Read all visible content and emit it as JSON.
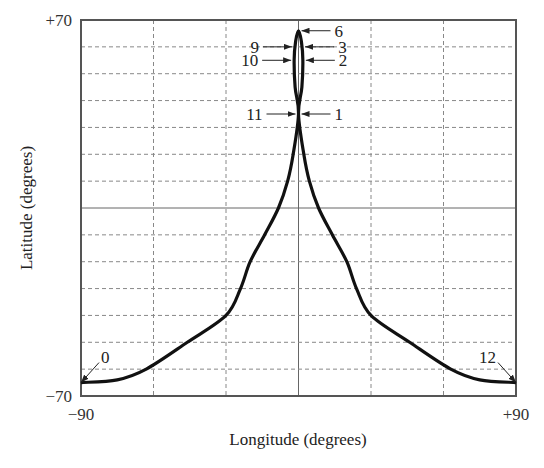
{
  "chart_data": {
    "type": "line",
    "title": "",
    "xlabel": "Longitude (degrees)",
    "ylabel": "Latitude (degrees)",
    "xlim": [
      -90,
      90
    ],
    "ylim": [
      -70,
      70
    ],
    "x_tick_labels": [
      "-90",
      "+90"
    ],
    "y_tick_labels": [
      "+70",
      "-70"
    ],
    "grid": {
      "on": true,
      "style": "dashed",
      "x_step": 30,
      "y_step": 10,
      "solid_lines": {
        "x": 0,
        "y": 0
      }
    },
    "legend": null,
    "series": [
      {
        "name": "ground track",
        "points": [
          [
            -90,
            -65
          ],
          [
            -75,
            -64
          ],
          [
            -63,
            -60
          ],
          [
            -46,
            -50
          ],
          [
            -30,
            -40
          ],
          [
            -24,
            -30
          ],
          [
            -20,
            -20
          ],
          [
            -14,
            -10
          ],
          [
            -8.3,
            0
          ],
          [
            -4.5,
            10
          ],
          [
            -2.2,
            20
          ],
          [
            0,
            35
          ],
          [
            -1.4,
            45
          ],
          [
            -1.8,
            55
          ],
          [
            -1.2,
            62
          ],
          [
            0,
            66
          ],
          [
            1.2,
            62
          ],
          [
            1.8,
            55
          ],
          [
            1.4,
            45
          ],
          [
            0,
            35
          ],
          [
            2.2,
            20
          ],
          [
            4.5,
            10
          ],
          [
            8.3,
            0
          ],
          [
            14,
            -10
          ],
          [
            20,
            -20
          ],
          [
            24,
            -30
          ],
          [
            30,
            -40
          ],
          [
            46,
            -50
          ],
          [
            63,
            -60
          ],
          [
            75,
            -64
          ],
          [
            90,
            -65
          ]
        ]
      }
    ],
    "annotations": [
      {
        "label": "0",
        "lon": -90,
        "lat": -65,
        "text_side": "upper-right"
      },
      {
        "label": "1",
        "lon": 0,
        "lat": 35,
        "text_side": "right"
      },
      {
        "label": "2",
        "lon": 1.8,
        "lat": 55,
        "text_side": "right"
      },
      {
        "label": "3",
        "lon": 1.5,
        "lat": 60,
        "text_side": "right"
      },
      {
        "label": "6",
        "lon": 0,
        "lat": 66,
        "text_side": "right"
      },
      {
        "label": "9",
        "lon": -1.5,
        "lat": 60,
        "text_side": "left"
      },
      {
        "label": "10",
        "lon": -1.8,
        "lat": 55,
        "text_side": "left"
      },
      {
        "label": "11",
        "lon": 0,
        "lat": 35,
        "text_side": "left"
      },
      {
        "label": "12",
        "lon": 90,
        "lat": -65,
        "text_side": "upper-left"
      }
    ]
  },
  "labels": {
    "y_top": "+70",
    "y_bottom": "−70",
    "x_left": "−90",
    "x_right": "+90",
    "x_title": "Longitude (degrees)",
    "y_title": "Latitude (degrees)"
  },
  "colors": {
    "curve": "#111111",
    "frame": "#555555",
    "grid": "#777777"
  }
}
